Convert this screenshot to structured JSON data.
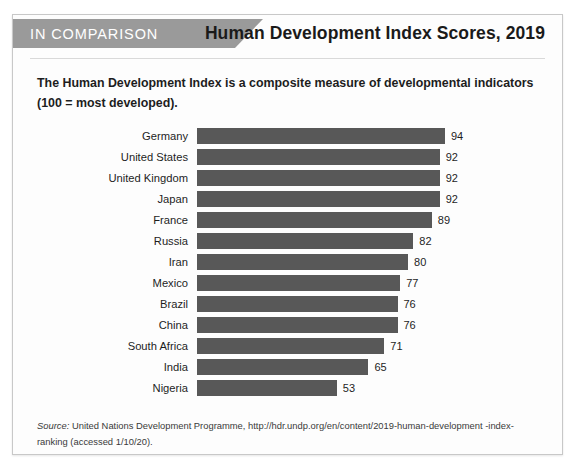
{
  "card": {
    "eyebrow": "IN COMPARISON",
    "title": "Human Development Index Scores, 2019",
    "subtitle": "The Human Development Index is a composite measure of developmental indicators (100 = most developed).",
    "source_label": "Source:",
    "source_text": " United Nations Development Programme, http://hdr.undp.org/en/content/2019-human-development -index-ranking (accessed 1/10/20)."
  },
  "colors": {
    "bar": "#585858",
    "banner": "#9a9a9a",
    "card_border": "#c8c8c8",
    "card_background": "#fdfdfd",
    "title_text": "#1a1a1a"
  },
  "chart_data": {
    "type": "bar",
    "orientation": "horizontal",
    "title": "Human Development Index Scores, 2019",
    "subtitle": "The Human Development Index is a composite measure of developmental indicators (100 = most developed).",
    "xlabel": "",
    "ylabel": "",
    "xlim": [
      0,
      100
    ],
    "grid": false,
    "legend": false,
    "categories": [
      "Germany",
      "United States",
      "United Kingdom",
      "Japan",
      "France",
      "Russia",
      "Iran",
      "Mexico",
      "Brazil",
      "China",
      "South Africa",
      "India",
      "Nigeria"
    ],
    "values": [
      94,
      92,
      92,
      92,
      89,
      82,
      80,
      77,
      76,
      76,
      71,
      65,
      53
    ],
    "value_labels": [
      "94",
      "92",
      "92",
      "92",
      "89",
      "82",
      "80",
      "77",
      "76",
      "76",
      "71",
      "65",
      "53"
    ]
  }
}
